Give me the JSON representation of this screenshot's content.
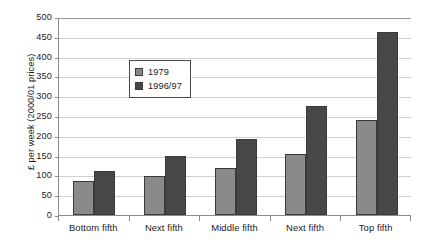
{
  "chart_data": {
    "type": "bar",
    "title": "",
    "subtitle": "",
    "xlabel": "",
    "ylabel": "£ per week (2000/01 prices)",
    "categories": [
      "Bottom fifth",
      "Next fifth",
      "Middle fifth",
      "Next fifth",
      "Top fifth"
    ],
    "series": [
      {
        "name": "1979",
        "color": "#8a8a8a",
        "values": [
          85,
          98,
          118,
          155,
          240
        ]
      },
      {
        "name": "1996/97",
        "color": "#474747",
        "values": [
          112,
          150,
          193,
          275,
          462
        ]
      }
    ],
    "ylim": [
      0,
      500
    ],
    "ytick_step": 50,
    "ytick_labels": [
      "0",
      "50",
      "100",
      "150",
      "200",
      "250",
      "300",
      "350",
      "400",
      "450",
      "500"
    ],
    "ytick_values": [
      0,
      50,
      100,
      150,
      200,
      250,
      300,
      350,
      400,
      450,
      500
    ],
    "grid": true,
    "grid_axis": "y",
    "legend_position": "top-left-inside",
    "plot_background": "#ffffff",
    "gridline_color": "#cfcfcf",
    "axis_color": "#8c8c8c"
  }
}
